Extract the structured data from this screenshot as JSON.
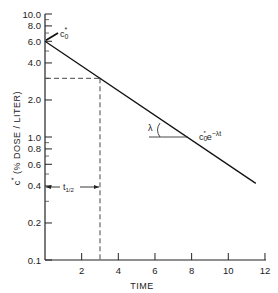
{
  "chart_data": {
    "type": "line",
    "title": "",
    "xlabel": "TIME",
    "ylabel": "c* (% DOSE / LITER)",
    "xscale": "linear",
    "yscale": "log",
    "xlim": [
      0,
      12
    ],
    "ylim": [
      0.1,
      10.0
    ],
    "grid": false,
    "x_ticks": [
      "2",
      "4",
      "6",
      "8",
      "10",
      "12"
    ],
    "y_ticks": [
      "10.0",
      "8.0",
      "6.0",
      "4.0",
      "2.0",
      "1.0",
      "0.8",
      "0.6",
      "0.4",
      "0.2",
      "0.1"
    ],
    "series": [
      {
        "name": "c0* e^(-λt)",
        "x": [
          0,
          3,
          6,
          9,
          11.5
        ],
        "values": [
          6.0,
          3.0,
          1.5,
          0.75,
          0.42
        ]
      }
    ],
    "annotations": [
      {
        "text": "c0*",
        "target": "y-intercept at t=0, c=6.0"
      },
      {
        "text": "c0*e^(-λt)",
        "target": "fitted line label"
      },
      {
        "text": "λ",
        "target": "angle between line and horizontal"
      },
      {
        "text": "t1/2",
        "target": "half-life interval from t=0 to t=3 (c from 6.0 to 3.0)"
      }
    ],
    "reference_lines": [
      {
        "type": "horizontal-dashed",
        "y": 3.0,
        "x_range": [
          0,
          3
        ]
      },
      {
        "type": "vertical-dashed",
        "x": 3.0,
        "y_range": [
          0.1,
          3.0
        ]
      }
    ]
  },
  "labels": {
    "xlabel": "TIME",
    "ylabel_c": "c",
    "ylabel_star": "*",
    "ylabel_rest": " (% DOSE / LITER)",
    "c0_main": "c",
    "c0_sub": "0",
    "c0_star": "*",
    "fit_c": "c",
    "fit_sub": "0",
    "fit_star": "*",
    "fit_e": "e",
    "fit_exp": "−λt",
    "lambda": "λ",
    "thalf_t": "t",
    "thalf_sub": "1/2"
  },
  "ticks": {
    "y": [
      {
        "label": "10.0",
        "v": 10.0
      },
      {
        "label": "8.0",
        "v": 8.0
      },
      {
        "label": "6.0",
        "v": 6.0
      },
      {
        "label": "4.0",
        "v": 4.0
      },
      {
        "label": "2.0",
        "v": 2.0
      },
      {
        "label": "1.0",
        "v": 1.0
      },
      {
        "label": "0.8",
        "v": 0.8
      },
      {
        "label": "0.6",
        "v": 0.6
      },
      {
        "label": "0.4",
        "v": 0.4
      },
      {
        "label": "0.2",
        "v": 0.2
      },
      {
        "label": "0.1",
        "v": 0.1
      }
    ],
    "x": [
      {
        "label": "2",
        "v": 2
      },
      {
        "label": "4",
        "v": 4
      },
      {
        "label": "6",
        "v": 6
      },
      {
        "label": "8",
        "v": 8
      },
      {
        "label": "10",
        "v": 10
      },
      {
        "label": "12",
        "v": 12
      }
    ]
  }
}
